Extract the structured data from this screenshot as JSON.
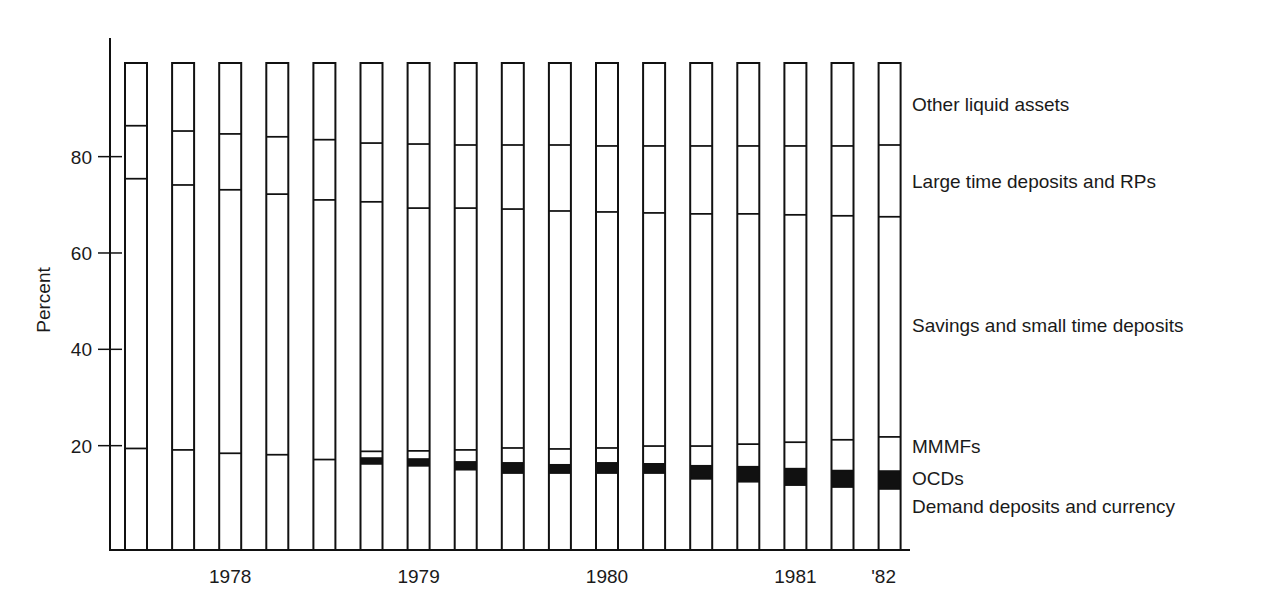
{
  "chart_data": {
    "type": "bar",
    "stacked": true,
    "normalized_to_percent": true,
    "title": "",
    "xlabel": "",
    "ylabel": "Percent",
    "ylim": [
      0,
      100
    ],
    "yticks": [
      20,
      40,
      60,
      80
    ],
    "grid": false,
    "legend_placement": "right (labels aligned with segments)",
    "x_tick_labels": [
      {
        "label": "1978",
        "between_bars": [
          2,
          3
        ]
      },
      {
        "label": "1979",
        "between_bars": [
          6,
          7
        ]
      },
      {
        "label": "1980",
        "between_bars": [
          10,
          11
        ]
      },
      {
        "label": "1981",
        "between_bars": [
          14,
          15
        ]
      },
      {
        "label": "'82",
        "at_bar": 16
      }
    ],
    "bar_count": 17,
    "series_order_bottom_to_top": [
      "Demand deposits and currency",
      "OCDs",
      "MMMFs",
      "Savings and small time deposits",
      "Large time deposits and RPs",
      "Other liquid assets"
    ],
    "series": [
      {
        "name": "Demand deposits and currency",
        "fill": "#ffffff",
        "values": [
          19.6,
          19.3,
          18.6,
          18.3,
          17.3,
          16.4,
          16.0,
          15.2,
          14.5,
          14.5,
          14.5,
          14.5,
          13.3,
          12.7,
          12.0,
          11.6,
          11.2
        ]
      },
      {
        "name": "OCDs",
        "fill": "#111111",
        "values": [
          0,
          0,
          0,
          0,
          0,
          1.2,
          1.4,
          1.6,
          2.1,
          1.7,
          2.1,
          1.9,
          2.7,
          3.1,
          3.4,
          3.4,
          3.7
        ]
      },
      {
        "name": "MMMFs",
        "fill": "#ffffff",
        "values": [
          0,
          0,
          0,
          0,
          0,
          1.4,
          1.7,
          2.5,
          3.1,
          3.3,
          3.1,
          3.7,
          4.1,
          4.7,
          5.5,
          6.4,
          7.1
        ]
      },
      {
        "name": "Savings and small time deposits",
        "fill": "#ffffff",
        "values": [
          56.0,
          55.0,
          54.7,
          54.1,
          53.9,
          51.8,
          50.4,
          50.2,
          49.6,
          49.4,
          49.0,
          48.4,
          48.2,
          47.8,
          47.2,
          46.5,
          45.7
        ]
      },
      {
        "name": "Large time deposits and RPs",
        "fill": "#ffffff",
        "values": [
          11.0,
          11.2,
          11.6,
          11.9,
          12.5,
          12.2,
          13.3,
          13.1,
          13.3,
          13.7,
          13.7,
          13.9,
          14.1,
          14.1,
          14.3,
          14.5,
          14.9
        ]
      },
      {
        "name": "Other liquid assets",
        "fill": "#ffffff",
        "values": [
          13.4,
          14.5,
          15.1,
          15.7,
          16.3,
          17.0,
          17.2,
          17.4,
          17.4,
          17.4,
          17.6,
          17.6,
          17.6,
          17.6,
          17.6,
          17.5,
          17.4
        ]
      }
    ],
    "legend": [
      {
        "label": "Other liquid assets",
        "at_percent": 91
      },
      {
        "label": "Large time deposits and RPs",
        "at_percent": 75
      },
      {
        "label": "Savings and small time deposits",
        "at_percent": 45
      },
      {
        "label": "MMMFs",
        "at_percent": 20
      },
      {
        "label": "OCDs",
        "at_percent": 13.3
      },
      {
        "label": "Demand deposits and currency",
        "at_percent": 7.5
      }
    ]
  },
  "colors": {
    "ink": "#111111",
    "background": "#ffffff"
  }
}
